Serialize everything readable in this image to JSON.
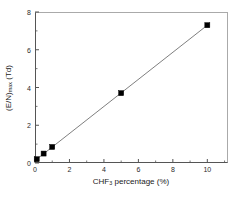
{
  "chart_data": {
    "type": "scatter",
    "title": "",
    "xlabel_parts": {
      "pre": "CHF",
      "sub": "3",
      "post": " percentage (%)"
    },
    "xlabel": "CHF3 percentage (%)",
    "ylabel_parts": {
      "pre": "(E/N)",
      "sub": "max",
      "post": " (Td)"
    },
    "ylabel": "(E/N)max (Td)",
    "xlim": [
      0,
      11.2
    ],
    "ylim": [
      0,
      8
    ],
    "xticks": [
      0,
      2,
      4,
      6,
      8,
      10
    ],
    "xtick_labels": [
      "0",
      "2",
      "4",
      "6",
      "8",
      "10"
    ],
    "yticks": [
      0,
      2,
      4,
      6,
      8
    ],
    "ytick_labels": [
      "0",
      "2",
      "4",
      "6",
      "8"
    ],
    "x_minor_ticks": [
      1,
      3,
      5,
      7,
      9,
      11
    ],
    "y_minor_ticks": [
      1,
      3,
      5,
      7
    ],
    "grid": false,
    "legend": null,
    "marker": "filled-square",
    "marker_color": "#000000",
    "line_color": "#707070",
    "axis_color": "#555555",
    "x": [
      0.1,
      0.5,
      1.0,
      5.0,
      10.0
    ],
    "y": [
      0.2,
      0.5,
      0.85,
      3.7,
      7.3
    ],
    "series": [
      {
        "name": "(E/N)max vs CHF3 percentage",
        "points": [
          {
            "x": 0.1,
            "y": 0.2
          },
          {
            "x": 0.5,
            "y": 0.5
          },
          {
            "x": 1.0,
            "y": 0.85
          },
          {
            "x": 5.0,
            "y": 3.7
          },
          {
            "x": 10.0,
            "y": 7.3
          }
        ]
      }
    ],
    "trend_line": {
      "from": {
        "x": 0.1,
        "y": 0.2
      },
      "to": {
        "x": 10.0,
        "y": 7.3
      }
    }
  }
}
